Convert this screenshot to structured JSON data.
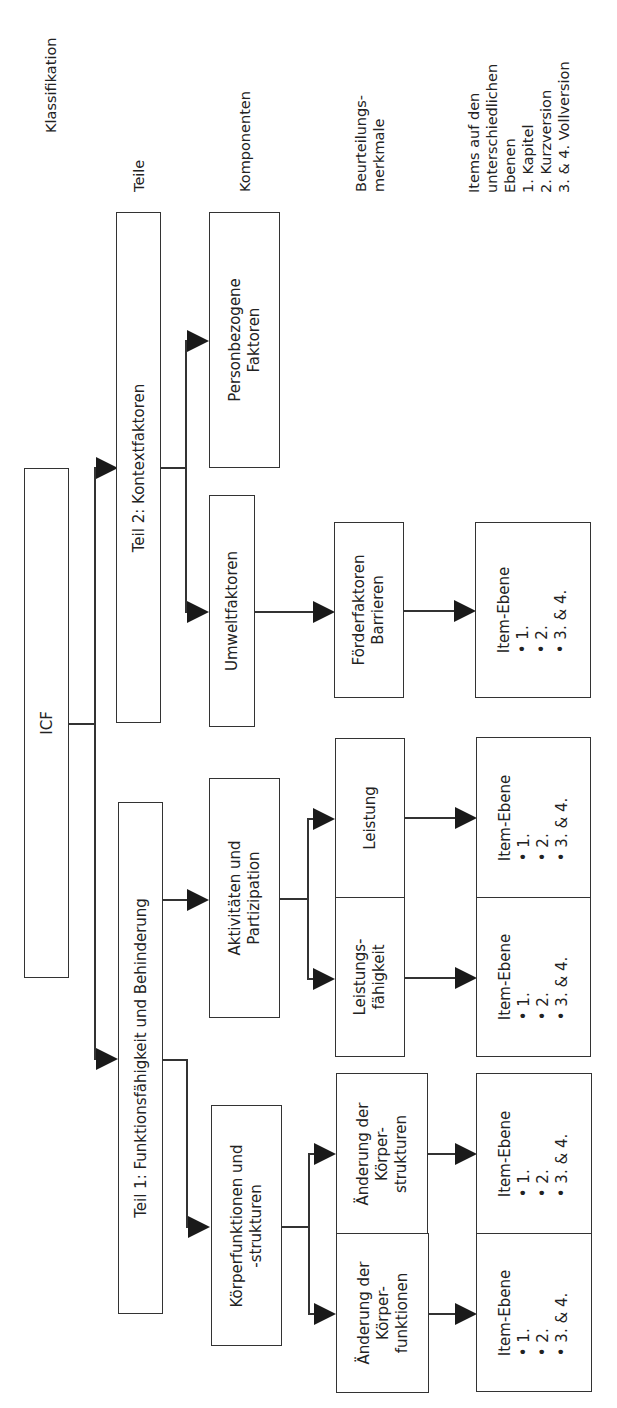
{
  "header_labels": {
    "klassifikation": "Klassifikation",
    "teile": "Teile",
    "komponenten": "Komponenten",
    "beurteilungsmerkmale": "Beurteilungs-\nmerkmale",
    "items": "Items auf den\nunterschiedlichen\nEbenen\n1. Kapitel\n2. Kurzversion\n3. & 4. Vollversion"
  },
  "nodes": {
    "icf": "ICF",
    "teil1": "Teil 1: Funktionsfähigkeit und Behinderung",
    "teil2": "Teil 2: Kontextfaktoren",
    "koerper": "Körperfunktionen und\n-strukturen",
    "aktivitaeten": "Aktivitäten und\nPartizipation",
    "umwelt": "Umweltfaktoren",
    "person": "Personbezogene\nFaktoren",
    "aend_funktionen": "Änderung der\nKörper-\nfunktionen",
    "aend_strukturen": "Änderung der\nKörper-\nstrukturen",
    "leistungsfaehigkeit": "Leistungs-\nfähigkeit",
    "leistung": "Leistung",
    "foerder": "Förderfaktoren\nBarrieren"
  },
  "item_box": {
    "title": "Item-Ebene",
    "levels": [
      "1.",
      "2.",
      "3. & 4."
    ]
  }
}
